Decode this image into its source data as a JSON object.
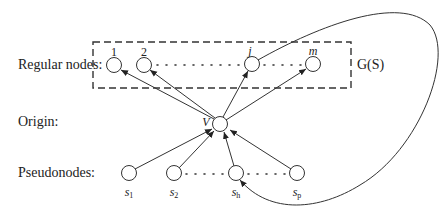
{
  "diagram": {
    "row_labels": {
      "regular": "Regular nodes:",
      "origin": "Origin:",
      "pseudo": "Pseudonodes:"
    },
    "group_label": "G(S)",
    "regular_nodes": [
      {
        "id": "1",
        "label": "1",
        "x": 114,
        "y": 65
      },
      {
        "id": "2",
        "label": "2",
        "x": 144,
        "y": 65
      },
      {
        "id": "j",
        "label": "j",
        "x": 252,
        "y": 64
      },
      {
        "id": "m",
        "label": "m",
        "x": 313,
        "y": 64
      }
    ],
    "origin_node": {
      "id": "V",
      "label": "V",
      "x": 220,
      "y": 124
    },
    "pseudo_nodes": [
      {
        "id": "s1",
        "base": "s",
        "sub": "1",
        "x": 129,
        "y": 173
      },
      {
        "id": "s2",
        "base": "s",
        "sub": "2",
        "x": 174,
        "y": 173
      },
      {
        "id": "sh",
        "base": "s",
        "sub": "h",
        "x": 236,
        "y": 173
      },
      {
        "id": "sp",
        "base": "s",
        "sub": "p",
        "x": 297,
        "y": 173
      }
    ],
    "edges": [
      {
        "from": "V",
        "to": "1"
      },
      {
        "from": "V",
        "to": "2"
      },
      {
        "from": "V",
        "to": "j"
      },
      {
        "from": "V",
        "to": "m"
      },
      {
        "from": "s1",
        "to": "V"
      },
      {
        "from": "s2",
        "to": "V"
      },
      {
        "from": "sh",
        "to": "V"
      },
      {
        "from": "sp",
        "to": "V"
      },
      {
        "from": "j",
        "to": "sh",
        "curved": true
      }
    ],
    "ellipsis_links": [
      {
        "between": [
          "2",
          "j"
        ]
      },
      {
        "between": [
          "j",
          "m"
        ]
      },
      {
        "between": [
          "s2",
          "sh"
        ]
      },
      {
        "between": [
          "sh",
          "sp"
        ]
      }
    ]
  }
}
